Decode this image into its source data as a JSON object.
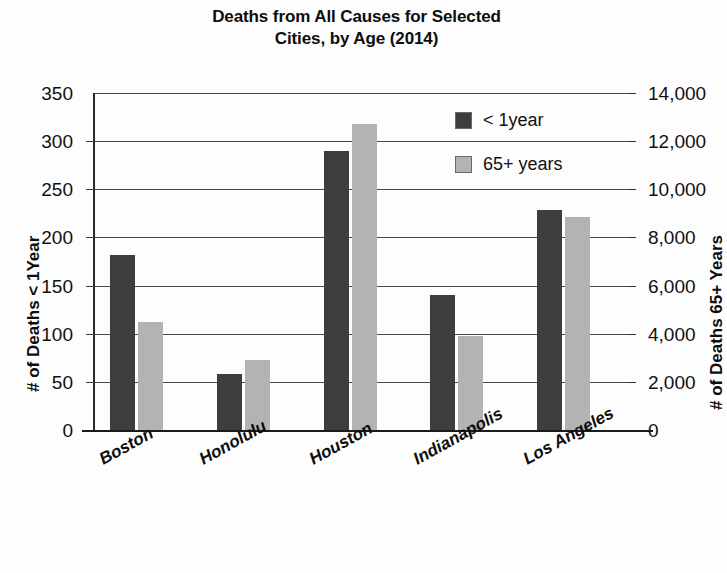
{
  "chart_data": {
    "type": "bar",
    "title": "Deaths from All Causes for Selected Cities, by Age (2014)",
    "title_line1": "Deaths from All Causes for Selected",
    "title_line2": "Cities, by Age (2014)",
    "categories": [
      "Boston",
      "Honolulu",
      "Houston",
      "Indianapolis",
      "Los Angeles"
    ],
    "series": [
      {
        "name": "< 1year",
        "axis": "left",
        "color": "#3d3d3d",
        "values": [
          182,
          58,
          290,
          140,
          228
        ]
      },
      {
        "name": "65+ years",
        "axis": "right",
        "color": "#b3b3b3",
        "values": [
          4500,
          2900,
          12700,
          3900,
          8850
        ]
      }
    ],
    "xlabel": "",
    "ylabel": "# of Deaths < 1Year",
    "y2label": "# of Deaths 65+ Years",
    "ylim": [
      0,
      350
    ],
    "y2lim": [
      0,
      14000
    ],
    "yticks": [
      "0",
      "50",
      "100",
      "150",
      "200",
      "250",
      "300",
      "350"
    ],
    "ytick_values": [
      0,
      50,
      100,
      150,
      200,
      250,
      300,
      350
    ],
    "y2ticks": [
      "0",
      "2,000",
      "4,000",
      "6,000",
      "8,000",
      "10,000",
      "12,000",
      "14,000"
    ],
    "y2tick_values": [
      0,
      2000,
      4000,
      6000,
      8000,
      10000,
      12000,
      14000
    ],
    "grid": true,
    "grid_axis": "y",
    "legend_position": "upper right"
  },
  "axes": {
    "left_title": "# of Deaths < 1Year",
    "right_title": "# of Deaths 65+ Years"
  },
  "legend": {
    "items": [
      {
        "label": "< 1year",
        "color": "#3d3d3d"
      },
      {
        "label": "65+ years",
        "color": "#b3b3b3"
      }
    ]
  }
}
